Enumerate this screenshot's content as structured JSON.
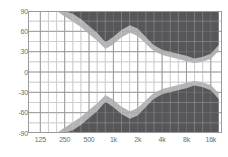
{
  "chart_data": {
    "type": "area",
    "title": "",
    "subtitle": "",
    "xlabel": "",
    "ylabel": "",
    "grid": true,
    "legend": false,
    "legend_position": "none",
    "x_scale": "log",
    "x_tick_labels": [
      "125",
      "250",
      "500",
      "1k",
      "2k",
      "4k",
      "8k",
      "16k"
    ],
    "x_tick_values": [
      125,
      250,
      500,
      1000,
      2000,
      4000,
      8000,
      16000
    ],
    "xlim": [
      88,
      22000
    ],
    "y_tick_labels": [
      "90",
      "60",
      "30",
      "0",
      "-30",
      "-60",
      "-90"
    ],
    "y_tick_values": [
      90,
      60,
      30,
      0,
      -30,
      -60,
      -90
    ],
    "ylim": [
      -90,
      90
    ],
    "minor_gridlines": true,
    "colors": {
      "dark_band": "#57575a",
      "transition_band": "#b4b4b6",
      "grid_major": "#9a9a9c",
      "grid_minor": "#cfcfd1",
      "plot_background": "#ffffff",
      "tick_label": "#6d6d6d",
      "page_background": "#ffffff"
    },
    "series": [
      {
        "name": "upper-dark-boundary",
        "description": "Inner edge of the upper dark masked region",
        "x": [
          125,
          160,
          200,
          250,
          315,
          400,
          500,
          630,
          800,
          1000,
          1250,
          1600,
          2000,
          2500,
          3150,
          4000,
          5000,
          6300,
          8000,
          10000,
          12500,
          16000,
          20000
        ],
        "values": [
          90,
          90,
          90,
          90,
          86,
          78,
          68,
          58,
          44,
          52,
          62,
          69,
          64,
          52,
          40,
          33,
          30,
          27,
          24,
          20,
          22,
          27,
          40
        ]
      },
      {
        "name": "upper-transition-boundary",
        "description": "Outer edge of the grey transition band above the dark region",
        "x": [
          125,
          160,
          200,
          250,
          315,
          400,
          500,
          630,
          800,
          1000,
          1250,
          1600,
          2000,
          2500,
          3150,
          4000,
          5000,
          6300,
          8000,
          10000,
          12500,
          16000,
          20000
        ],
        "values": [
          90,
          90,
          90,
          82,
          74,
          66,
          56,
          46,
          34,
          41,
          51,
          58,
          53,
          42,
          31,
          25,
          22,
          19,
          16,
          13,
          15,
          19,
          31
        ]
      },
      {
        "name": "lower-dark-boundary",
        "description": "Inner edge of the lower dark masked region",
        "x": [
          125,
          160,
          200,
          250,
          315,
          400,
          500,
          630,
          800,
          1000,
          1250,
          1600,
          2000,
          2500,
          3150,
          4000,
          5000,
          6300,
          8000,
          10000,
          12500,
          16000,
          20000
        ],
        "values": [
          -90,
          -90,
          -90,
          -90,
          -86,
          -78,
          -68,
          -58,
          -44,
          -52,
          -62,
          -69,
          -64,
          -52,
          -40,
          -33,
          -30,
          -27,
          -24,
          -20,
          -22,
          -27,
          -40
        ]
      },
      {
        "name": "lower-transition-boundary",
        "description": "Outer edge of the grey transition band below the dark region",
        "x": [
          125,
          160,
          200,
          250,
          315,
          400,
          500,
          630,
          800,
          1000,
          1250,
          1600,
          2000,
          2500,
          3150,
          4000,
          5000,
          6300,
          8000,
          10000,
          12500,
          16000,
          20000
        ],
        "values": [
          -90,
          -90,
          -90,
          -82,
          -74,
          -66,
          -56,
          -46,
          -34,
          -41,
          -51,
          -58,
          -53,
          -42,
          -31,
          -25,
          -22,
          -19,
          -16,
          -13,
          -15,
          -19,
          -31
        ]
      }
    ]
  }
}
